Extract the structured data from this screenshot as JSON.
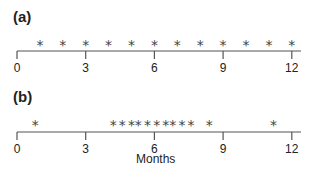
{
  "chart_data": [
    {
      "type": "scatter",
      "panel": "(a)",
      "title": "",
      "xlabel": "",
      "xlim": [
        0,
        12
      ],
      "xticks": [
        0,
        3,
        6,
        9,
        12
      ],
      "marker": "*",
      "x": [
        1,
        2,
        3,
        4,
        5,
        6,
        7,
        8,
        9,
        10,
        11,
        12
      ]
    },
    {
      "type": "scatter",
      "panel": "(b)",
      "title": "",
      "xlabel": "Months",
      "xlim": [
        0,
        12
      ],
      "xticks": [
        0,
        3,
        6,
        9,
        12
      ],
      "marker": "*",
      "x": [
        0.8,
        4.2,
        4.6,
        5.0,
        5.3,
        5.7,
        6.1,
        6.5,
        6.8,
        7.2,
        7.6,
        8.4,
        11.2
      ]
    }
  ],
  "labels": {
    "panel_a": "(a)",
    "panel_b": "(b)",
    "xlabel": "Months",
    "ticks": [
      "0",
      "3",
      "6",
      "9",
      "12"
    ]
  }
}
